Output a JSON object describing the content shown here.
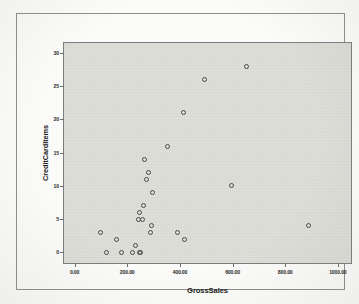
{
  "chart_data": {
    "type": "scatter",
    "title": "",
    "xlabel": "GrossSales",
    "ylabel": "CreditCardItems",
    "xlim": [
      -40,
      1050
    ],
    "ylim": [
      -1.6,
      31.5
    ],
    "grid": false,
    "legend": false,
    "xticks": [
      0,
      200,
      400,
      600,
      800,
      1000
    ],
    "xtick_labels": [
      "0.00",
      "200.00",
      "400.00",
      "600.00",
      "800.00",
      "1000.00"
    ],
    "yticks": [
      0,
      5,
      10,
      15,
      20,
      25,
      30
    ],
    "ytick_labels": [
      "0",
      "5",
      "10",
      "15",
      "20",
      "25",
      "30"
    ],
    "marker": "open-circle",
    "marker_color": "#4a4a4a",
    "points": [
      {
        "x": 100,
        "y": 3
      },
      {
        "x": 123,
        "y": 0
      },
      {
        "x": 160,
        "y": 2
      },
      {
        "x": 178,
        "y": 0
      },
      {
        "x": 222,
        "y": 0
      },
      {
        "x": 232,
        "y": 1
      },
      {
        "x": 243,
        "y": 5
      },
      {
        "x": 245,
        "y": 6
      },
      {
        "x": 248,
        "y": 0
      },
      {
        "x": 250,
        "y": 0
      },
      {
        "x": 258,
        "y": 5
      },
      {
        "x": 262,
        "y": 7
      },
      {
        "x": 266,
        "y": 14
      },
      {
        "x": 272,
        "y": 11
      },
      {
        "x": 282,
        "y": 12
      },
      {
        "x": 288,
        "y": 3
      },
      {
        "x": 292,
        "y": 4
      },
      {
        "x": 298,
        "y": 9
      },
      {
        "x": 352,
        "y": 16
      },
      {
        "x": 392,
        "y": 3
      },
      {
        "x": 412,
        "y": 21
      },
      {
        "x": 418,
        "y": 2
      },
      {
        "x": 492,
        "y": 26
      },
      {
        "x": 596,
        "y": 10
      },
      {
        "x": 652,
        "y": 28
      },
      {
        "x": 888,
        "y": 4
      }
    ],
    "colors": {
      "panel_fill": "#dcdcd7",
      "panel_border": "#7d7d7d",
      "frame_border": "#8e8e8e",
      "page": "#fdfdfb",
      "marker": "#4a4a4a",
      "text": "#1a1a1a"
    }
  }
}
